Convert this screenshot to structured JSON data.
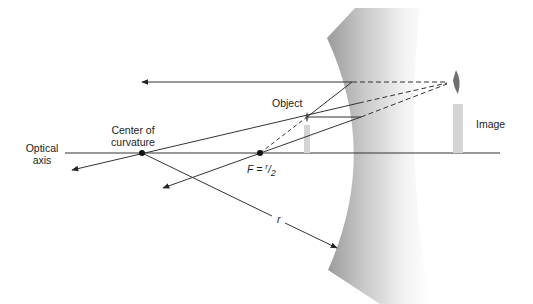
{
  "labels": {
    "optical_axis_line1": "Optical",
    "optical_axis_line2": "axis",
    "center_line1": "Center of",
    "center_line2": "curvature",
    "object": "Object",
    "image": "Image",
    "focal_prefix": "F = ",
    "focal_num": "r",
    "focal_slash": "/",
    "focal_den": "2",
    "radius": "r"
  },
  "colors": {
    "line": "#333333",
    "mirror_dark": "#9a9a9a",
    "candle": "#d4d4d4",
    "flame": "#6f6f6f"
  }
}
